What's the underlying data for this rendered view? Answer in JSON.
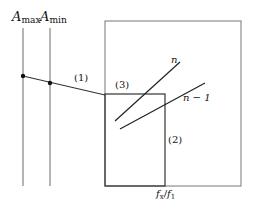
{
  "diagram": {
    "labels": {
      "a_max_main": "A",
      "a_max_sub": "max",
      "a_min_main": "A",
      "a_min_sub": "min",
      "segment_1": "(1)",
      "segment_2": "(2)",
      "segment_3": "(3)",
      "curve_n": "n",
      "curve_n_minus_1": "n − 1",
      "axis_f_x": "f",
      "axis_f_x_sub": "x",
      "axis_sep": "/",
      "axis_f_1": "f",
      "axis_f_1_sub": "1"
    },
    "colors": {
      "line": "#2a2a2a",
      "box": "#555555",
      "background": "#ffffff"
    }
  }
}
